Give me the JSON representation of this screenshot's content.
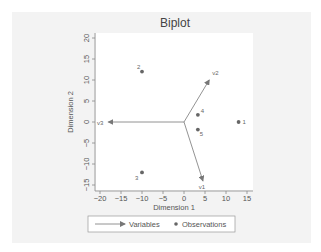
{
  "chart_data": {
    "type": "scatter",
    "subtype": "biplot",
    "title": "Biplot",
    "xlabel": "Dimension 1",
    "ylabel": "Dimension 2",
    "xlim": [
      -21,
      16.5
    ],
    "ylim": [
      -16.5,
      21
    ],
    "xticks": [
      -20,
      -15,
      -10,
      -5,
      0,
      5,
      10,
      15
    ],
    "yticks": [
      -15,
      -10,
      -5,
      0,
      5,
      10,
      15,
      20
    ],
    "grid": false,
    "legend_position": "bottom",
    "legend": [
      {
        "label": "Variables",
        "marker": "arrow"
      },
      {
        "label": "Observations",
        "marker": "dot"
      }
    ],
    "series": [
      {
        "name": "Variables",
        "type": "vectors",
        "points": [
          {
            "label": "v1",
            "x": 4.5,
            "y": -14
          },
          {
            "label": "v2",
            "x": 6,
            "y": 10
          },
          {
            "label": "v3",
            "x": -18,
            "y": 0
          }
        ]
      },
      {
        "name": "Observations",
        "type": "scatter",
        "points": [
          {
            "label": "1",
            "x": 13,
            "y": 0
          },
          {
            "label": "2",
            "x": -10,
            "y": 12
          },
          {
            "label": "3",
            "x": -10,
            "y": -12
          },
          {
            "label": "4",
            "x": 3.3,
            "y": 1.7
          },
          {
            "label": "5",
            "x": 3.3,
            "y": -1.8
          }
        ]
      }
    ]
  },
  "colors": {
    "panel_bg": "#f3f3f3",
    "plot_bg": "#ffffff",
    "axis": "#777777",
    "text": "#555555",
    "vector": "#777777",
    "point": "#666666"
  }
}
